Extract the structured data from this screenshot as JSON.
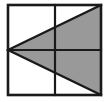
{
  "figure": {
    "title": "Square divided into quadrants with two shaded triangles",
    "type": "geometric-diagram",
    "canvas": {
      "width": 108,
      "height": 102,
      "background": "#ffffff"
    },
    "colors": {
      "shade": "#999999",
      "stroke": "#1a1a1a",
      "background": "#ffffff"
    },
    "square": {
      "name": "outer-square",
      "left": 8,
      "top": 5,
      "right": 101,
      "bottom": 95,
      "stroke_width": 2.6
    },
    "dividers": [
      {
        "name": "vertical-midline",
        "x1": 55,
        "y1": 5,
        "x2": 55,
        "y2": 95,
        "stroke_width": 2.2
      },
      {
        "name": "horizontal-midline",
        "x1": 8,
        "y1": 50,
        "x2": 101,
        "y2": 50,
        "stroke_width": 2.2
      }
    ],
    "apex": {
      "x": 8,
      "y": 50,
      "label": "left-edge-midpoint"
    },
    "shaded_regions": [
      {
        "name": "upper-shaded-triangle",
        "points": "8,50 101,5 101,50",
        "vertices": [
          [
            8,
            50
          ],
          [
            101,
            5
          ],
          [
            101,
            50
          ]
        ],
        "fill": "#999999"
      },
      {
        "name": "lower-shaded-triangle",
        "points": "8,50 101,95 101,50",
        "vertices": [
          [
            8,
            50
          ],
          [
            101,
            95
          ],
          [
            101,
            50
          ]
        ],
        "fill": "#999999"
      }
    ],
    "diagonals": [
      {
        "name": "upper-diagonal",
        "x1": 8,
        "y1": 50,
        "x2": 101,
        "y2": 5,
        "stroke_width": 2.4
      },
      {
        "name": "lower-diagonal",
        "x1": 8,
        "y1": 50,
        "x2": 101,
        "y2": 95,
        "stroke_width": 2.4
      }
    ],
    "caption": ""
  }
}
